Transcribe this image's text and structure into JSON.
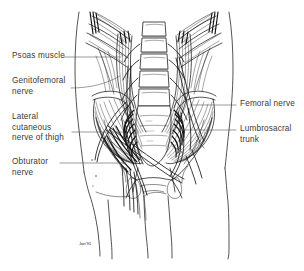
{
  "figure": {
    "style": "pen-and-ink anatomical line drawing",
    "background_color": "#ffffff",
    "ink_color": "#1a1a1a",
    "label_color": "#3a3a3a",
    "leader_color": "#55595c",
    "signature": "Jan'91"
  },
  "labels": {
    "left": [
      {
        "id": "psoas-muscle",
        "text": "Psoas muscle"
      },
      {
        "id": "genitofemoral-nerve",
        "text": "Genitofemoral\nnerve"
      },
      {
        "id": "lateral-cutaneous-nerve",
        "text": "Lateral\ncutaneous\nnerve of thigh"
      },
      {
        "id": "obturator-nerve",
        "text": "Obturator\nnerve"
      }
    ],
    "right": [
      {
        "id": "femoral-nerve",
        "text": "Femoral nerve"
      },
      {
        "id": "lumbosacral-trunk",
        "text": "Lumbrosacral\ntrunk"
      }
    ]
  },
  "structures": [
    "rib cage",
    "lumbar vertebrae",
    "intervertebral discs",
    "sacrum",
    "sacral foramina",
    "iliac crest",
    "ilium",
    "psoas major muscle",
    "iliacus muscle",
    "quadratus lumborum",
    "lumbar plexus nerve roots",
    "torso outline",
    "thigh outline"
  ]
}
